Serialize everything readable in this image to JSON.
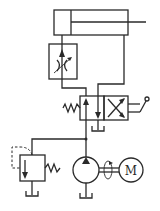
{
  "diagram": {
    "type": "hydraulic-circuit",
    "components": [
      {
        "id": "cylinder",
        "kind": "single-rod double-acting hydraulic cylinder"
      },
      {
        "id": "throttle-valve",
        "kind": "adjustable throttle / flow control valve"
      },
      {
        "id": "directional-valve",
        "kind": "2-position 4-way directional valve, spring return, manual lever"
      },
      {
        "id": "relief-valve",
        "kind": "pressure relief valve"
      },
      {
        "id": "pump",
        "kind": "fixed displacement hydraulic pump"
      },
      {
        "id": "motor",
        "kind": "electric motor",
        "label": "M"
      },
      {
        "id": "tanks",
        "kind": "reservoir symbols",
        "count": 3
      }
    ],
    "motor_label": "M",
    "lever_label": "P",
    "line_color": "#2a2a2a",
    "background": "#ffffff"
  }
}
